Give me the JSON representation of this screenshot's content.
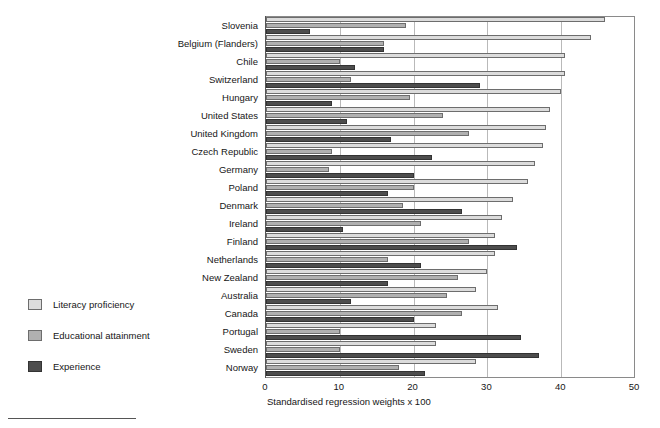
{
  "chart_data": {
    "type": "bar",
    "orientation": "horizontal",
    "title": "",
    "xlabel": "Standardised regression weights x 100",
    "ylabel": "",
    "xlim": [
      0,
      50
    ],
    "xticks": [
      0,
      10,
      20,
      30,
      40,
      50
    ],
    "grid": true,
    "legend_position": "left-outside",
    "categories": [
      "Slovenia",
      "Belgium (Flanders)",
      "Chile",
      "Switzerland",
      "Hungary",
      "United States",
      "United Kingdom",
      "Czech Republic",
      "Germany",
      "Poland",
      "Denmark",
      "Ireland",
      "Finland",
      "Netherlands",
      "New Zealand",
      "Australia",
      "Canada",
      "Portugal",
      "Sweden",
      "Norway"
    ],
    "series": [
      {
        "name": "Literacy proficiency",
        "color": "#dcdcdc",
        "values": [
          46.0,
          44.0,
          40.5,
          40.5,
          40.0,
          38.5,
          38.0,
          37.5,
          36.5,
          35.5,
          33.5,
          32.0,
          31.0,
          31.0,
          30.0,
          28.5,
          31.5,
          23.0,
          23.0,
          28.5
        ]
      },
      {
        "name": "Educational attainment",
        "color": "#b0b0b0",
        "values": [
          19.0,
          16.0,
          10.0,
          11.5,
          19.5,
          24.0,
          27.5,
          9.0,
          8.5,
          20.0,
          18.5,
          21.0,
          27.5,
          16.5,
          26.0,
          24.5,
          26.5,
          10.0,
          10.0,
          18.0
        ]
      },
      {
        "name": "Experience",
        "color": "#4d4d4d",
        "values": [
          6.0,
          16.0,
          12.0,
          29.0,
          9.0,
          11.0,
          17.0,
          22.5,
          20.0,
          16.5,
          26.5,
          10.5,
          34.0,
          21.0,
          16.5,
          11.5,
          20.0,
          34.5,
          37.0,
          21.5
        ]
      }
    ]
  },
  "legend": {
    "items": [
      {
        "label": "Literacy proficiency",
        "key": "lit"
      },
      {
        "label": "Educational attainment",
        "key": "edu"
      },
      {
        "label": "Experience",
        "key": "exp"
      }
    ]
  }
}
